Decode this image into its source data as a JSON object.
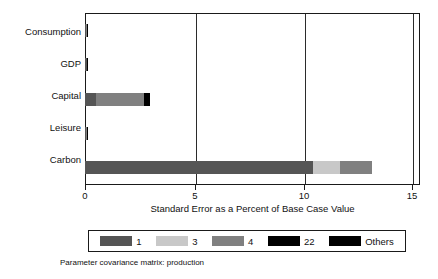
{
  "chart_data": {
    "type": "bar",
    "orientation": "horizontal",
    "stacked": true,
    "title": "",
    "xlabel": "Standard Error as a Percent of Base Case Value",
    "ylabel": "",
    "xlim": [
      0,
      15
    ],
    "xticks": [
      0,
      5,
      10,
      15
    ],
    "xtick_labels": [
      "0",
      "5",
      "10",
      "15"
    ],
    "grid": true,
    "grid_axis": "x",
    "legend_position": "bottom",
    "categories": [
      "Consumption",
      "GDP",
      "Capital",
      "Leisure",
      "Carbon"
    ],
    "series": [
      {
        "name": "1",
        "color": "#555555",
        "values": [
          0.05,
          0.07,
          0.5,
          0.05,
          10.2
        ]
      },
      {
        "name": "3",
        "color": "#c8c8c8",
        "values": [
          0.0,
          0.0,
          0.0,
          0.0,
          1.2
        ]
      },
      {
        "name": "4",
        "color": "#808080",
        "values": [
          0.03,
          0.02,
          2.15,
          0.03,
          1.45
        ]
      },
      {
        "name": "22",
        "color": "#000000",
        "values": [
          0.0,
          0.04,
          0.0,
          0.0,
          0.0
        ]
      },
      {
        "name": "Others",
        "color": "#000000",
        "values": [
          0.02,
          0.0,
          0.25,
          0.02,
          0.0
        ]
      }
    ],
    "totals": [
      0.1,
      0.13,
      2.9,
      0.1,
      12.85
    ],
    "caption": "Parameter covariance matrix: production"
  },
  "legend": {
    "items": [
      {
        "label": "1",
        "color": "#555555"
      },
      {
        "label": "3",
        "color": "#c8c8c8"
      },
      {
        "label": "4",
        "color": "#808080"
      },
      {
        "label": "22",
        "color": "#000000"
      },
      {
        "label": "Others",
        "color": "#000000"
      }
    ]
  }
}
